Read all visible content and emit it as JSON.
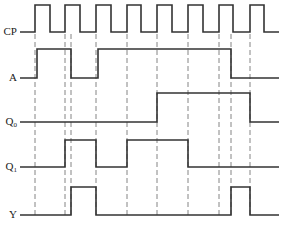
{
  "diagram": {
    "type": "timing-diagram",
    "signals": [
      {
        "id": "cp",
        "label": "CP",
        "sub": "",
        "y_low": 32,
        "y_high": 5,
        "label_y": 35,
        "start_x": 20,
        "end_x": 279,
        "edges": [
          35,
          50,
          65,
          80,
          96,
          111,
          127,
          141,
          157,
          172,
          188,
          203,
          219,
          233,
          250,
          264
        ],
        "initial": 0
      },
      {
        "id": "a",
        "label": "A",
        "sub": "",
        "y_low": 78,
        "y_high": 49,
        "label_y": 81,
        "start_x": 20,
        "end_x": 279,
        "edges": [
          37,
          71,
          98,
          231
        ],
        "initial": 0
      },
      {
        "id": "q0",
        "label": "Q",
        "sub": "0",
        "y_low": 122,
        "y_high": 93,
        "label_y": 125,
        "start_x": 20,
        "end_x": 279,
        "edges": [
          157,
          250
        ],
        "initial": 0
      },
      {
        "id": "q1",
        "label": "Q",
        "sub": "1",
        "y_low": 167,
        "y_high": 140,
        "label_y": 170,
        "start_x": 20,
        "end_x": 279,
        "edges": [
          65,
          96,
          127,
          188
        ],
        "initial": 0
      },
      {
        "id": "y",
        "label": "Y",
        "sub": "",
        "y_low": 215,
        "y_high": 187,
        "label_y": 218,
        "start_x": 20,
        "end_x": 279,
        "edges": [
          71,
          96,
          231,
          250
        ],
        "initial": 0
      }
    ],
    "dashed_guides": [
      35,
      65,
      71,
      96,
      127,
      157,
      188,
      219,
      231,
      250
    ],
    "guide_top": 34,
    "guide_bottom": 215
  }
}
